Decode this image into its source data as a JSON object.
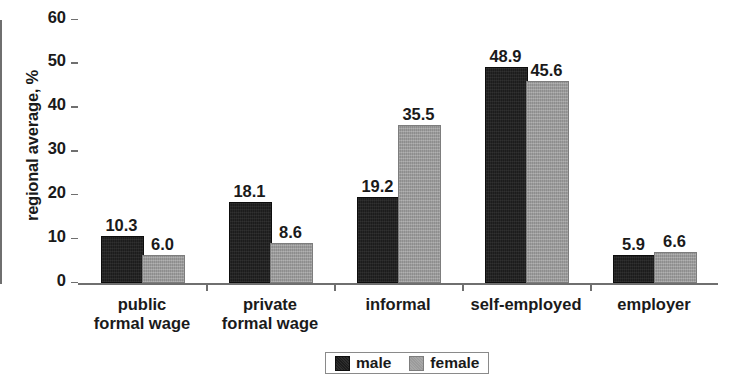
{
  "chart_data": {
    "type": "bar",
    "title": "",
    "xlabel": "",
    "ylabel": "regional average, %",
    "ylim": [
      0,
      60
    ],
    "yticks": [
      0,
      10,
      20,
      30,
      40,
      50,
      60
    ],
    "ytick_labels": [
      "0",
      "10",
      "20",
      "30",
      "40",
      "50",
      "60"
    ],
    "grid": false,
    "legend_position": "bottom",
    "categories": [
      "public\nformal wage",
      "private\nformal wage",
      "informal",
      "self-employed",
      "employer"
    ],
    "series": [
      {
        "name": "male",
        "color": "#1c1c1c",
        "values": [
          10.3,
          18.1,
          19.2,
          48.9,
          5.9
        ],
        "labels": [
          "10.3",
          "18.1",
          "19.2",
          "48.9",
          "5.9"
        ]
      },
      {
        "name": "female",
        "color": "#9b9b9b",
        "values": [
          6.0,
          8.6,
          35.5,
          45.6,
          6.6
        ],
        "labels": [
          "6.0",
          "8.6",
          "35.5",
          "45.6",
          "6.6"
        ]
      }
    ]
  },
  "legend": {
    "items": [
      {
        "label": "male",
        "swatch": "male-swatch-icon"
      },
      {
        "label": "female",
        "swatch": "female-swatch-icon"
      }
    ]
  }
}
